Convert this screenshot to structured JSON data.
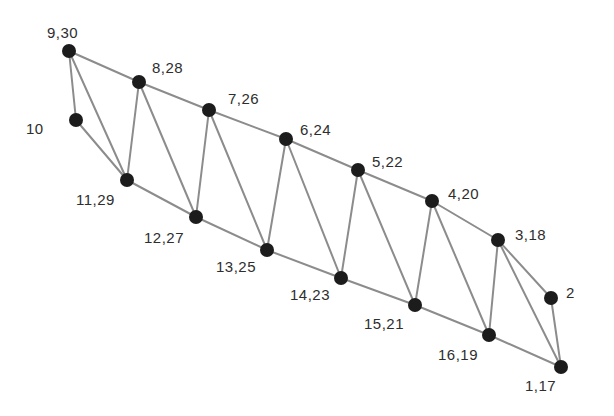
{
  "diagram": {
    "title": "",
    "nodes": [
      {
        "id": "9",
        "label": "9,30",
        "x": 69,
        "y": 51,
        "lx": 47,
        "ly": 38
      },
      {
        "id": "8",
        "label": "8,28",
        "x": 139,
        "y": 82,
        "lx": 152,
        "ly": 73
      },
      {
        "id": "7",
        "label": "7,26",
        "x": 209,
        "y": 110,
        "lx": 228,
        "ly": 104
      },
      {
        "id": "6",
        "label": "6,24",
        "x": 286,
        "y": 139,
        "lx": 300,
        "ly": 135
      },
      {
        "id": "5",
        "label": "5,22",
        "x": 358,
        "y": 170,
        "lx": 372,
        "ly": 167
      },
      {
        "id": "4",
        "label": "4,20",
        "x": 432,
        "y": 201,
        "lx": 448,
        "ly": 199
      },
      {
        "id": "3",
        "label": "3,18",
        "x": 498,
        "y": 240,
        "lx": 515,
        "ly": 240
      },
      {
        "id": "2",
        "label": "2",
        "x": 551,
        "y": 298,
        "lx": 566,
        "ly": 298
      },
      {
        "id": "1",
        "label": "1,17",
        "x": 561,
        "y": 367,
        "lx": 525,
        "ly": 391
      },
      {
        "id": "16",
        "label": "16,19",
        "x": 489,
        "y": 335,
        "lx": 438,
        "ly": 360
      },
      {
        "id": "15",
        "label": "15,21",
        "x": 415,
        "y": 305,
        "lx": 364,
        "ly": 329
      },
      {
        "id": "14",
        "label": "14,23",
        "x": 341,
        "y": 278,
        "lx": 290,
        "ly": 300
      },
      {
        "id": "13",
        "label": "13,25",
        "x": 267,
        "y": 250,
        "lx": 216,
        "ly": 272
      },
      {
        "id": "12",
        "label": "12,27",
        "x": 196,
        "y": 217,
        "lx": 144,
        "ly": 243
      },
      {
        "id": "11",
        "label": "11,29",
        "x": 127,
        "y": 180,
        "lx": 76,
        "ly": 205
      },
      {
        "id": "10",
        "label": "10",
        "x": 76,
        "y": 120,
        "lx": 26,
        "ly": 134
      }
    ],
    "edges": [
      [
        "9",
        "8"
      ],
      [
        "8",
        "7"
      ],
      [
        "7",
        "6"
      ],
      [
        "6",
        "5"
      ],
      [
        "5",
        "4"
      ],
      [
        "4",
        "3"
      ],
      [
        "3",
        "2"
      ],
      [
        "2",
        "1"
      ],
      [
        "9",
        "10"
      ],
      [
        "10",
        "11"
      ],
      [
        "9",
        "11"
      ],
      [
        "11",
        "12"
      ],
      [
        "12",
        "13"
      ],
      [
        "13",
        "14"
      ],
      [
        "14",
        "15"
      ],
      [
        "15",
        "16"
      ],
      [
        "16",
        "1"
      ],
      [
        "8",
        "11"
      ],
      [
        "8",
        "12"
      ],
      [
        "7",
        "12"
      ],
      [
        "7",
        "13"
      ],
      [
        "6",
        "13"
      ],
      [
        "6",
        "14"
      ],
      [
        "5",
        "14"
      ],
      [
        "5",
        "15"
      ],
      [
        "4",
        "15"
      ],
      [
        "4",
        "16"
      ],
      [
        "3",
        "16"
      ],
      [
        "3",
        "1"
      ]
    ],
    "colors": {
      "edge": "#8c8c8c",
      "node": "#1c1c1c",
      "label": "#2e2e2e",
      "background": "#ffffff"
    }
  }
}
